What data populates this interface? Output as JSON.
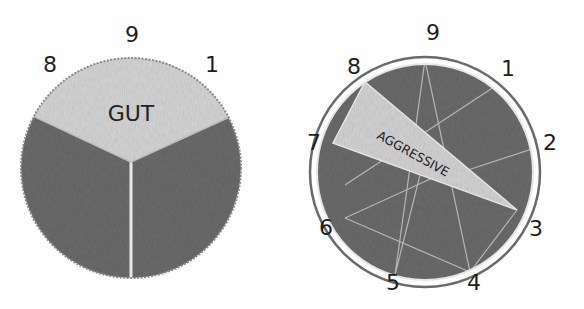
{
  "colors": {
    "background": "#fefefe",
    "dark_region": "#6e6e6e",
    "light_wedge": "#d3d3d3",
    "divider": "#e6e6e6",
    "ink": "#1e1e1e"
  },
  "diagrams": [
    {
      "id": "gut",
      "wedge_label": "GUT",
      "labels": [
        {
          "text": "8",
          "position": "top-left"
        },
        {
          "text": "9",
          "position": "top"
        },
        {
          "text": "1",
          "position": "top-right"
        }
      ]
    },
    {
      "id": "aggressive",
      "wedge_label": "AGGRESSIVE",
      "labels": [
        {
          "text": "9",
          "position": "top"
        },
        {
          "text": "1",
          "position": "top-right"
        },
        {
          "text": "2",
          "position": "right-upper"
        },
        {
          "text": "3",
          "position": "right-lower"
        },
        {
          "text": "4",
          "position": "bottom-right"
        },
        {
          "text": "5",
          "position": "bottom-left"
        },
        {
          "text": "6",
          "position": "left-lower"
        },
        {
          "text": "7",
          "position": "left-upper"
        },
        {
          "text": "8",
          "position": "top-left"
        }
      ]
    }
  ]
}
